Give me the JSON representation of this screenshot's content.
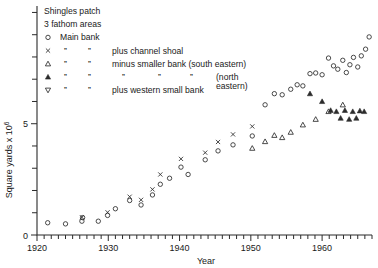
{
  "chart_data": {
    "type": "scatter",
    "title": "",
    "xlabel": "Year",
    "ylabel": "Square yards x 10⁶",
    "xlim": [
      1920,
      1967
    ],
    "ylim": [
      0,
      10.2
    ],
    "xticks": [
      1920,
      1930,
      1940,
      1950,
      1960
    ],
    "xtick_labels": [
      "1920",
      "1930",
      "1940",
      "1950",
      "1960"
    ],
    "x_minor_tick_interval": 1,
    "yticks": [
      0,
      5
    ],
    "ytick_labels": [
      "0",
      "5"
    ],
    "y_minor_tick_interval": 1,
    "grid": false,
    "legend_position": "top-left",
    "legend_title": "Shingles patch",
    "legend_subtitle": "3 fathom areas",
    "legend_entries": [
      {
        "marker": "circle-open",
        "label": "Main bank",
        "ditto": []
      },
      {
        "marker": "cross",
        "label": "plus channel shoal",
        "ditto": [
          "”",
          "”"
        ]
      },
      {
        "marker": "triangle-up-open",
        "label": "minus smaller bank (south eastern)",
        "ditto": [
          "”",
          "”"
        ]
      },
      {
        "marker": "triangle-up-filled",
        "label": "(north eastern)",
        "ditto": [
          "”",
          "”",
          "”",
          "”",
          "”"
        ]
      },
      {
        "marker": "triangle-down-open",
        "label": "plus western small bank",
        "ditto": [
          "”",
          "”"
        ]
      }
    ],
    "series": [
      {
        "name": "Main bank",
        "marker": "circle-open",
        "points": [
          [
            1921.5,
            0.55
          ],
          [
            1924.0,
            0.5
          ],
          [
            1926.3,
            0.62
          ],
          [
            1926.4,
            0.78
          ],
          [
            1928.6,
            0.62
          ],
          [
            1929.9,
            0.88
          ],
          [
            1931.0,
            1.18
          ],
          [
            1933.0,
            1.55
          ],
          [
            1934.6,
            1.35
          ],
          [
            1936.2,
            1.8
          ],
          [
            1937.3,
            2.28
          ],
          [
            1938.6,
            2.55
          ],
          [
            1940.2,
            3.05
          ],
          [
            1941.2,
            2.72
          ],
          [
            1943.6,
            3.38
          ],
          [
            1945.4,
            3.78
          ],
          [
            1947.5,
            4.05
          ],
          [
            1950.2,
            4.45
          ],
          [
            1952.0,
            5.85
          ],
          [
            1953.3,
            6.35
          ],
          [
            1954.4,
            6.3
          ],
          [
            1955.6,
            6.55
          ],
          [
            1956.5,
            6.75
          ],
          [
            1957.3,
            6.7
          ],
          [
            1958.3,
            7.25
          ],
          [
            1959.1,
            7.28
          ],
          [
            1960.0,
            7.2
          ],
          [
            1960.9,
            7.95
          ],
          [
            1961.6,
            7.6
          ],
          [
            1962.2,
            7.45
          ],
          [
            1962.9,
            7.85
          ],
          [
            1963.4,
            7.3
          ],
          [
            1963.9,
            7.65
          ],
          [
            1964.4,
            7.98
          ],
          [
            1965.0,
            7.55
          ],
          [
            1965.5,
            8.05
          ],
          [
            1966.1,
            8.35
          ],
          [
            1966.6,
            8.9
          ]
        ]
      },
      {
        "name": "Main bank plus channel shoal",
        "marker": "cross",
        "points": [
          [
            1926.3,
            0.8
          ],
          [
            1929.9,
            1.02
          ],
          [
            1933.0,
            1.72
          ],
          [
            1934.6,
            1.58
          ],
          [
            1936.2,
            2.05
          ],
          [
            1937.3,
            2.72
          ],
          [
            1940.2,
            3.42
          ],
          [
            1943.6,
            3.7
          ],
          [
            1945.4,
            4.18
          ],
          [
            1947.5,
            4.52
          ],
          [
            1950.2,
            4.88
          ]
        ]
      },
      {
        "name": "Main bank minus smaller bank (south eastern)",
        "marker": "triangle-up-open",
        "points": [
          [
            1950.2,
            3.9
          ],
          [
            1952.0,
            4.2
          ],
          [
            1953.3,
            4.48
          ],
          [
            1954.4,
            4.38
          ],
          [
            1955.6,
            4.62
          ],
          [
            1957.3,
            4.95
          ],
          [
            1959.1,
            5.2
          ],
          [
            1960.9,
            5.55
          ],
          [
            1962.9,
            5.85
          ]
        ]
      },
      {
        "name": "Main bank minus smaller bank (north eastern)",
        "marker": "triangle-up-filled",
        "points": [
          [
            1958.3,
            6.35
          ],
          [
            1960.0,
            6.0
          ],
          [
            1961.2,
            5.6
          ],
          [
            1962.0,
            5.55
          ],
          [
            1962.6,
            5.25
          ],
          [
            1963.2,
            5.6
          ],
          [
            1963.8,
            5.2
          ],
          [
            1964.3,
            5.55
          ],
          [
            1964.8,
            5.25
          ],
          [
            1965.3,
            5.58
          ],
          [
            1965.9,
            5.55
          ]
        ]
      },
      {
        "name": "Main bank plus western small bank",
        "marker": "triangle-down-open",
        "points": []
      }
    ]
  }
}
